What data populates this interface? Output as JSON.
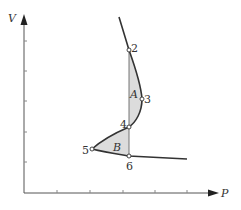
{
  "diagram": {
    "type": "P-V isotherm with equal-area (Maxwell) construction",
    "axes": {
      "y_label": "V",
      "x_label": "P",
      "x_ticks": 5,
      "y_ticks": 5
    },
    "points": [
      {
        "id": "2",
        "label": "2"
      },
      {
        "id": "3",
        "label": "3"
      },
      {
        "id": "4",
        "label": "4"
      },
      {
        "id": "5",
        "label": "5"
      },
      {
        "id": "6",
        "label": "6"
      }
    ],
    "regions": [
      {
        "id": "A",
        "label": "A"
      },
      {
        "id": "B",
        "label": "B"
      }
    ],
    "colors": {
      "curve": "#333333",
      "shade": "#dcdcdc",
      "axis": "#555555"
    }
  }
}
